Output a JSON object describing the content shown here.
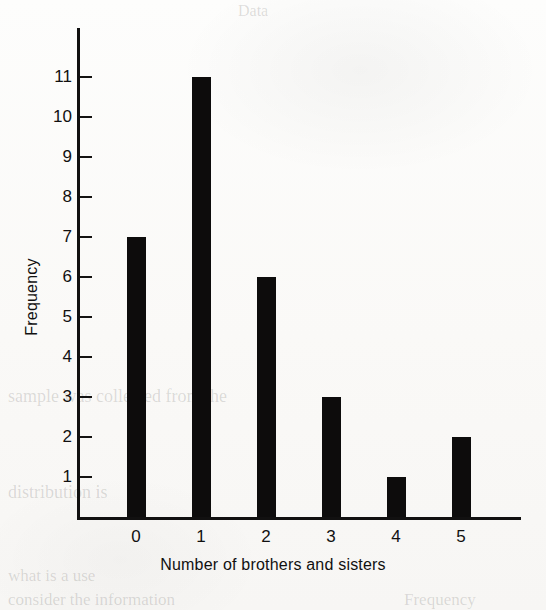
{
  "chart_data": {
    "type": "bar",
    "title": "",
    "subtitle": "",
    "xlabel": "Number of brothers and sisters",
    "ylabel": "Frequency",
    "categories": [
      "0",
      "1",
      "2",
      "3",
      "4",
      "5"
    ],
    "values": [
      7,
      11,
      6,
      3,
      1,
      2
    ],
    "series": [
      {
        "name": "Frequency",
        "values": [
          7,
          11,
          6,
          3,
          1,
          2
        ]
      }
    ],
    "ylim": [
      0,
      11
    ],
    "xlim": [
      -0.6,
      5.9
    ],
    "y_ticks": [
      1,
      2,
      3,
      4,
      5,
      6,
      7,
      8,
      9,
      10,
      11
    ],
    "y_tick_labels": [
      "1",
      "2",
      "3",
      "4",
      "5",
      "6",
      "7",
      "8",
      "9",
      "10",
      "11"
    ],
    "x_ticks": [
      0,
      1,
      2,
      3,
      4,
      5
    ],
    "x_tick_labels": [
      "0",
      "1",
      "2",
      "3",
      "4",
      "5"
    ],
    "grid": false,
    "legend": false,
    "legend_position": "none",
    "bar_color": "#0d0c0c",
    "axis_color": "#111010",
    "background_color": "#fbfbfa",
    "annotations": [],
    "total_frequency": 30
  },
  "artifacts": {
    "note": "scanned book page with faint bleed-through text from the reverse side",
    "ghost_texts": [
      {
        "text": "sample was collected from the",
        "x": 8,
        "y": 386,
        "size": 18,
        "mirrored": false
      },
      {
        "text": "distribution is",
        "x": 8,
        "y": 482,
        "size": 18,
        "mirrored": false
      },
      {
        "text": "what is a use",
        "x": 8,
        "y": 566,
        "size": 17,
        "mirrored": false
      },
      {
        "text": "consider the information",
        "x": 8,
        "y": 590,
        "size": 17,
        "mirrored": false
      },
      {
        "text": "Frequency",
        "x": 404,
        "y": 590,
        "size": 17,
        "mirrored": false
      },
      {
        "text": "Data",
        "x": 238,
        "y": 2,
        "size": 16,
        "mirrored": false
      }
    ]
  }
}
